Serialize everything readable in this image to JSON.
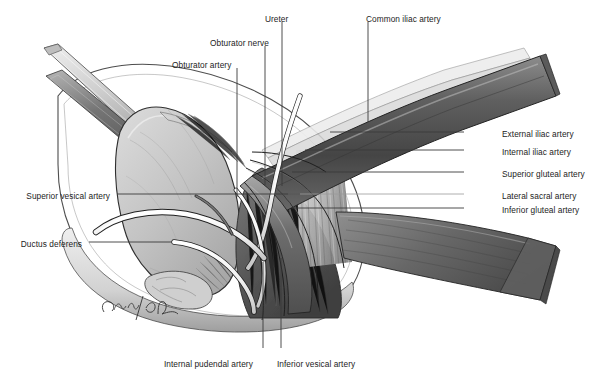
{
  "figure": {
    "background_color": "#ffffff",
    "width": 600,
    "height": 378,
    "signature": "C. Rus",
    "credit_line": ""
  },
  "palette": {
    "label_text": "#1c1c1c",
    "leader_line": "#3a3a3a",
    "leader_line_light": "#9a9a9a",
    "vessel_dark": "#4d4d4d",
    "vessel_mid": "#7b7b7b",
    "vessel_light": "#b9b9b9",
    "vessel_highlight": "#f2f2f2",
    "bladder_fill": "#c9c9c9",
    "bladder_shade": "#a9a9a9",
    "muscle_dark": "#5a5a5a",
    "muscle_mid": "#8a8a8a",
    "nerve_white": "#fbfbfb",
    "instrument_light": "#d6d6d6",
    "instrument_dark": "#6e6e6e",
    "outline": "#2e2e2e"
  },
  "labels": [
    {
      "id": "ureter",
      "text": "Ureter",
      "side": "top",
      "x": 265,
      "y": 14,
      "anchor": "middle"
    },
    {
      "id": "obturator-nerve",
      "text": "Obturator nerve",
      "side": "top",
      "x": 210,
      "y": 38,
      "anchor": "start"
    },
    {
      "id": "obturator-artery",
      "text": "Obturator artery",
      "side": "top",
      "x": 172,
      "y": 60,
      "anchor": "start"
    },
    {
      "id": "common-iliac-artery",
      "text": "Common iliac artery",
      "side": "top",
      "x": 366,
      "y": 14,
      "anchor": "start"
    },
    {
      "id": "external-iliac-artery",
      "text": "External iliac artery",
      "side": "right",
      "x": 502,
      "y": 129,
      "anchor": "start"
    },
    {
      "id": "internal-iliac-artery",
      "text": "Internal iliac artery",
      "side": "right",
      "x": 502,
      "y": 147,
      "anchor": "start"
    },
    {
      "id": "superior-gluteal-artery",
      "text": "Superior gluteal artery",
      "side": "right",
      "x": 502,
      "y": 169,
      "anchor": "start"
    },
    {
      "id": "lateral-sacral-artery",
      "text": "Lateral sacral artery",
      "side": "right",
      "x": 502,
      "y": 191,
      "anchor": "start"
    },
    {
      "id": "inferior-gluteal-artery",
      "text": "Inferior gluteal artery",
      "side": "right",
      "x": 502,
      "y": 205,
      "anchor": "start"
    },
    {
      "id": "superior-vesical-artery",
      "text": "Superior vesical artery",
      "side": "left",
      "x": 110,
      "y": 191,
      "anchor": "end"
    },
    {
      "id": "ductus-deferens",
      "text": "Ductus deferens",
      "side": "left",
      "x": 82,
      "y": 239,
      "anchor": "end"
    },
    {
      "id": "internal-pudendal-artery",
      "text": "Internal pudendal artery",
      "side": "bottom",
      "x": 164,
      "y": 359,
      "anchor": "start"
    },
    {
      "id": "inferior-vesical-artery",
      "text": "Inferior vesical artery",
      "side": "bottom",
      "x": 277,
      "y": 359,
      "anchor": "start"
    }
  ],
  "leaders": [
    {
      "id": "leader-ureter",
      "x1": 282,
      "y1": 22,
      "x2": 282,
      "y2": 186,
      "weight": "thin"
    },
    {
      "id": "leader-obturator-nerve",
      "x1": 265,
      "y1": 46,
      "x2": 265,
      "y2": 185,
      "weight": "thin"
    },
    {
      "id": "leader-obturator-artery",
      "x1": 237,
      "y1": 68,
      "x2": 237,
      "y2": 197,
      "weight": "thin"
    },
    {
      "id": "leader-common-iliac-artery",
      "x1": 368,
      "y1": 22,
      "x2": 368,
      "y2": 122,
      "weight": "thin"
    },
    {
      "id": "leader-external-iliac-artery",
      "x1": 464,
      "y1": 132,
      "x2": 330,
      "y2": 132,
      "weight": "thin"
    },
    {
      "id": "leader-internal-iliac-artery",
      "x1": 464,
      "y1": 150,
      "x2": 305,
      "y2": 150,
      "weight": "thin"
    },
    {
      "id": "leader-superior-gluteal-artery",
      "x1": 464,
      "y1": 172,
      "x2": 292,
      "y2": 172,
      "weight": "thin"
    },
    {
      "id": "leader-lateral-sacral-artery",
      "x1": 464,
      "y1": 194,
      "x2": 288,
      "y2": 194,
      "weight": "light"
    },
    {
      "id": "leader-inferior-gluteal-artery",
      "x1": 464,
      "y1": 208,
      "x2": 292,
      "y2": 208,
      "weight": "thin"
    },
    {
      "id": "leader-superior-vesical-artery",
      "x1": 117,
      "y1": 194,
      "x2": 300,
      "y2": 194,
      "weight": "thin"
    },
    {
      "id": "leader-ductus-deferens",
      "x1": 89,
      "y1": 242,
      "x2": 172,
      "y2": 242,
      "weight": "thin"
    },
    {
      "id": "leader-internal-pudendal-artery",
      "x1": 263,
      "y1": 348,
      "x2": 263,
      "y2": 262,
      "weight": "thin"
    },
    {
      "id": "leader-inferior-vesical-artery",
      "x1": 281,
      "y1": 348,
      "x2": 281,
      "y2": 258,
      "weight": "thin"
    }
  ],
  "structures": [
    {
      "id": "retractor-upper",
      "name": "surgical-retractor-upper"
    },
    {
      "id": "retractor-lower",
      "name": "surgical-retractor-lower"
    },
    {
      "id": "urinary-bladder",
      "name": "urinary-bladder"
    },
    {
      "id": "common-iliac-vessel",
      "name": "common-iliac-artery-vessel"
    },
    {
      "id": "external-iliac-vessel",
      "name": "external-iliac-artery-vessel"
    },
    {
      "id": "internal-iliac-vessel",
      "name": "internal-iliac-artery-vessel"
    },
    {
      "id": "ureter-tube",
      "name": "ureter-tube"
    },
    {
      "id": "ductus-deferens-tube",
      "name": "ductus-deferens-tube"
    },
    {
      "id": "pelvic-floor-muscle",
      "name": "pelvic-floor-muscle"
    },
    {
      "id": "peritoneal-rim",
      "name": "peritoneal-rim"
    }
  ]
}
